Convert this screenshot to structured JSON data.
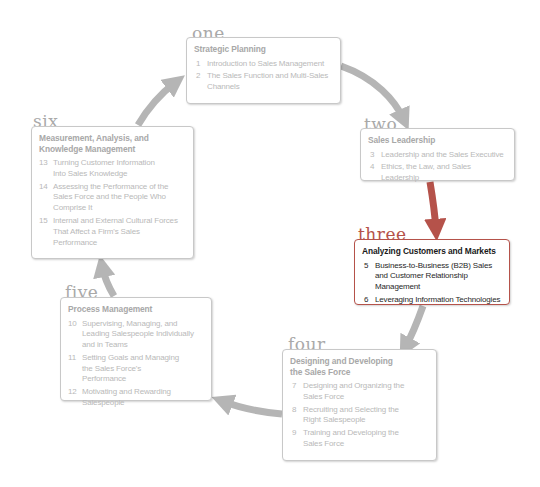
{
  "colors": {
    "inactive_arrow": "#b5b5b5",
    "active_arrow": "#b5524a",
    "inactive_border": "#c8c8c8",
    "active_border": "#b5524a",
    "inactive_text": "#b9b9b9",
    "active_text": "#1a1a1a"
  },
  "stages": [
    {
      "label": "one",
      "title": "Strategic Planning",
      "active": false,
      "chapters": [
        {
          "num": "1",
          "title": "Introduction to Sales Management"
        },
        {
          "num": "2",
          "title": "The Sales Function and Multi-Sales Channels"
        }
      ]
    },
    {
      "label": "two",
      "title": "Sales Leadership",
      "active": false,
      "chapters": [
        {
          "num": "3",
          "title": "Leadership and the Sales Executive"
        },
        {
          "num": "4",
          "title": "Ethics, the Law, and Sales Leadership"
        }
      ]
    },
    {
      "label": "three",
      "title": "Analyzing Customers and Markets",
      "active": true,
      "chapters": [
        {
          "num": "5",
          "title": "Business-to-Business (B2B) Sales and Customer Relationship Management"
        },
        {
          "num": "6",
          "title": "Leveraging Information Technologies"
        }
      ]
    },
    {
      "label": "four",
      "title": "Designing and Developing the Sales Force",
      "active": false,
      "chapters": [
        {
          "num": "7",
          "title": "Designing and Organizing the Sales Force"
        },
        {
          "num": "8",
          "title": "Recruiting and Selecting the Right Salespeople"
        },
        {
          "num": "9",
          "title": "Training and Developing the Sales Force"
        }
      ]
    },
    {
      "label": "five",
      "title": "Process Management",
      "active": false,
      "chapters": [
        {
          "num": "10",
          "title": "Supervising, Managing, and Leading Salespeople Individually and in Teams"
        },
        {
          "num": "11",
          "title": "Setting Goals and Managing the Sales Force's Performance"
        },
        {
          "num": "12",
          "title": "Motivating and Rewarding Salespeople"
        }
      ]
    },
    {
      "label": "six",
      "title": "Measurement, Analysis, and Knowledge Management",
      "active": false,
      "chapters": [
        {
          "num": "13",
          "title": "Turning Customer Information Into Sales Knowledge"
        },
        {
          "num": "14",
          "title": "Assessing the Performance of the Sales Force and the People Who Comprise It"
        },
        {
          "num": "15",
          "title": "Internal and External Cultural Forces That Affect a Firm's Sales Performance"
        }
      ]
    }
  ],
  "flow": [
    {
      "from": "one",
      "to": "two",
      "icon": "curved-arrow-icon",
      "active": false
    },
    {
      "from": "two",
      "to": "three",
      "icon": "curved-arrow-icon",
      "active": true
    },
    {
      "from": "three",
      "to": "four",
      "icon": "curved-arrow-icon",
      "active": false
    },
    {
      "from": "four",
      "to": "five",
      "icon": "curved-arrow-icon",
      "active": false
    },
    {
      "from": "five",
      "to": "six",
      "icon": "curved-arrow-icon",
      "active": false
    },
    {
      "from": "six",
      "to": "one",
      "icon": "curved-arrow-icon",
      "active": false
    }
  ]
}
